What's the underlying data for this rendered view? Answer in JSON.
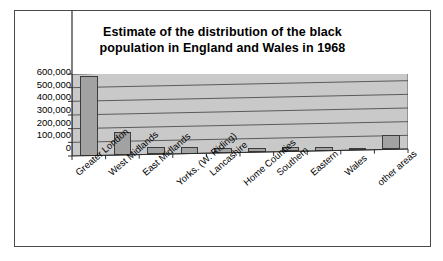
{
  "chart_data": {
    "type": "bar",
    "title": "Estimate of the distribution of the black population in England and Wales in 1968",
    "title_lines": [
      "Estimate of the distribution of the black",
      "population in England and Wales in 1968"
    ],
    "xlabel": "",
    "ylabel": "",
    "ylim": [
      0,
      600000
    ],
    "ytick_values": [
      600000,
      500000,
      400000,
      300000,
      200000,
      100000,
      0
    ],
    "ytick_labels": [
      "600,000",
      "500,000",
      "400,000",
      "300,000",
      "200,000",
      "100,000",
      "0"
    ],
    "grid": true,
    "legend": "none",
    "categories": [
      "Greater London",
      "West Midlands",
      "East Midlands",
      "Yorks. (W. Riding)",
      "Lancashire",
      "Home Counties",
      "Southern",
      "Eastern",
      "Wales",
      "other areas"
    ],
    "values": [
      580000,
      170000,
      50000,
      50000,
      35000,
      33000,
      30000,
      28000,
      6000,
      105000
    ],
    "series": [
      {
        "name": "Black population 1968",
        "values": [
          580000,
          170000,
          50000,
          50000,
          35000,
          33000,
          30000,
          28000,
          6000,
          105000
        ]
      }
    ],
    "colors": {
      "bar_fill": "#a2a2a2",
      "bar_edge": "#3c3c3c",
      "plot_background": "#c9c9c9",
      "gridline": "#5a5a5a",
      "frame_border": "#4a4a4a",
      "text": "#000000",
      "page_background": "#ffffff"
    }
  }
}
